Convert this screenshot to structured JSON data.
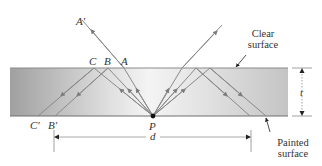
{
  "diagram": {
    "labels": {
      "A_prime": "A′",
      "A": "A",
      "B": "B",
      "C": "C",
      "B_prime": "B′",
      "C_prime": "C′",
      "P": "P",
      "d": "d",
      "t": "t"
    },
    "annotations": {
      "clear_surface_line1": "Clear",
      "clear_surface_line2": "surface",
      "painted_surface_line1": "Painted",
      "painted_surface_line2": "surface"
    },
    "colors": {
      "slab_dark": "#9e9e9e",
      "slab_light": "#f2f2f2",
      "ray": "#808080",
      "surface_line": "#7a7a7a",
      "text": "#333333"
    }
  }
}
